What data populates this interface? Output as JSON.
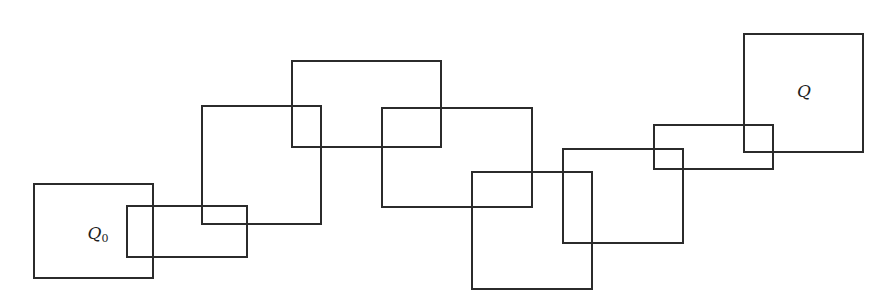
{
  "diagram": {
    "type": "chain-of-overlapping-rectangles",
    "stroke_color": "#2b2b2b",
    "background": "#ffffff",
    "rectangles": [
      {
        "id": "Q0",
        "x": 33,
        "y": 183,
        "w": 121,
        "h": 96,
        "label": "Q",
        "subscript": "0",
        "label_x": 98,
        "label_y": 234
      },
      {
        "id": "R1",
        "x": 126,
        "y": 205,
        "w": 122,
        "h": 53
      },
      {
        "id": "R2",
        "x": 201,
        "y": 105,
        "w": 121,
        "h": 120
      },
      {
        "id": "R3",
        "x": 291,
        "y": 60,
        "w": 151,
        "h": 88
      },
      {
        "id": "R4",
        "x": 381,
        "y": 107,
        "w": 152,
        "h": 101
      },
      {
        "id": "R5",
        "x": 471,
        "y": 171,
        "w": 122,
        "h": 119
      },
      {
        "id": "R6",
        "x": 562,
        "y": 148,
        "w": 122,
        "h": 96
      },
      {
        "id": "R7",
        "x": 653,
        "y": 124,
        "w": 121,
        "h": 46
      },
      {
        "id": "Q",
        "x": 743,
        "y": 33,
        "w": 121,
        "h": 120,
        "label": "Q",
        "subscript": "",
        "label_x": 804,
        "label_y": 91
      }
    ]
  },
  "labels": {
    "start": "Q",
    "start_sub": "0",
    "end": "Q"
  }
}
